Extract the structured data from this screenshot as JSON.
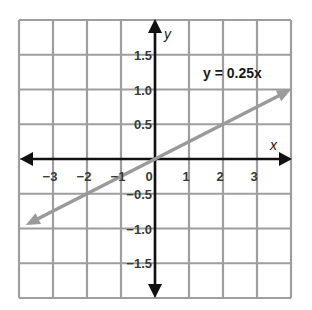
{
  "chart_data": {
    "type": "line",
    "title": "",
    "xlabel": "x",
    "ylabel": "y",
    "xlim": [
      -4,
      4
    ],
    "ylim": [
      -2,
      2
    ],
    "grid": true,
    "x_ticks": [
      -3,
      -2,
      -1,
      0,
      1,
      2,
      3
    ],
    "x_tick_labels": [
      "−3",
      "−2",
      "−1",
      "0",
      "1",
      "2",
      "3"
    ],
    "y_ticks": [
      1.5,
      1.0,
      0.5,
      -0.5,
      -1.0,
      -1.5
    ],
    "y_tick_labels": [
      "1.5",
      "1.0",
      "0.5",
      "−0.5",
      "−1.0",
      "−1.5"
    ],
    "series": [
      {
        "name": "y = 0.25x",
        "equation": "y = 0.25x",
        "slope": 0.25,
        "intercept": 0,
        "x": [
          -3.8,
          -3,
          -2,
          -1,
          0,
          1,
          2,
          3,
          4
        ],
        "y": [
          -0.95,
          -0.75,
          -0.5,
          -0.25,
          0,
          0.25,
          0.5,
          0.75,
          1.0
        ],
        "color": "#9a9a9a",
        "arrows": "both"
      }
    ],
    "annotations": [
      {
        "text": "y = 0.25x",
        "x": 2.4,
        "y": 1.25
      }
    ]
  },
  "labels": {
    "x_axis": "x",
    "y_axis": "y",
    "equation": "y = 0.25x",
    "origin": "0"
  },
  "colors": {
    "grid": "#9e9e9e",
    "axis": "#111111",
    "line": "#9a9a9a",
    "text": "#3a3a3a"
  }
}
